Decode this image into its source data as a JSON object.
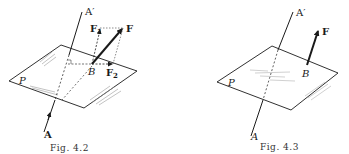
{
  "figures": [
    {
      "id": "fig-4-2",
      "caption": "Fig. 4.2",
      "labels": {
        "axis_top": "A′",
        "axis_bottom": "A",
        "plane": "P",
        "point": "B",
        "force": "F",
        "component1": "F",
        "component1_sub": "1",
        "component2": "F",
        "component2_sub": "2"
      }
    },
    {
      "id": "fig-4-3",
      "caption": "Fig. 4.3",
      "labels": {
        "axis_top": "A′",
        "axis_bottom": "A",
        "plane": "P",
        "point": "B",
        "force": "F"
      }
    }
  ],
  "colors": {
    "ink": "#1a1a1a",
    "hatch": "#9a9a9a",
    "background": "#ffffff"
  }
}
